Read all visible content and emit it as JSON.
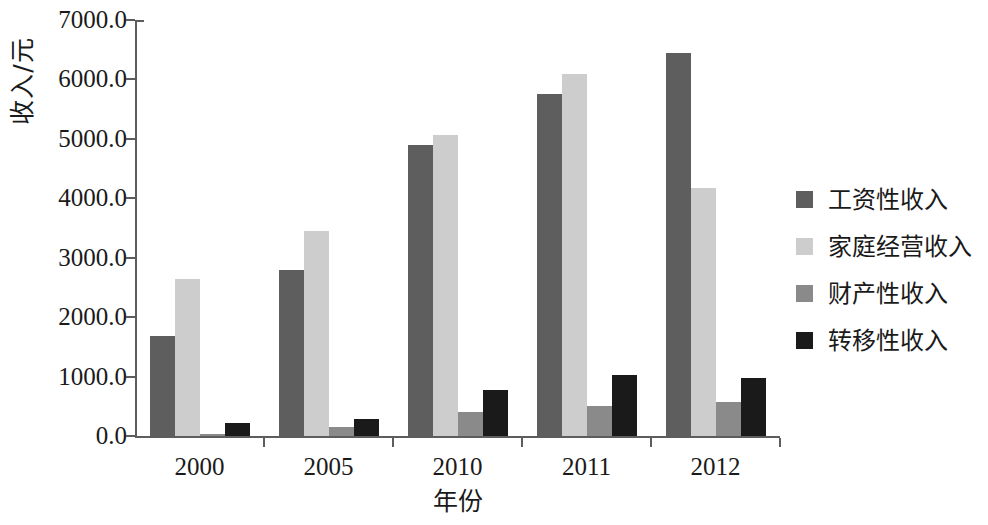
{
  "chart_data": {
    "type": "bar",
    "title": "",
    "xlabel": "年份",
    "ylabel": "收入/元",
    "categories": [
      "2000",
      "2005",
      "2010",
      "2011",
      "2012"
    ],
    "series": [
      {
        "name": "工资性收入",
        "color": "#5e5e5e",
        "values": [
          1680,
          2800,
          4890,
          5750,
          6450
        ]
      },
      {
        "name": "家庭经营收入",
        "color": "#cdcdcd",
        "values": [
          2650,
          3450,
          5060,
          6100,
          4170
        ]
      },
      {
        "name": "财产性收入",
        "color": "#8a8a8a",
        "values": [
          30,
          150,
          410,
          500,
          570
        ]
      },
      {
        "name": "转移性收入",
        "color": "#1a1a1a",
        "values": [
          220,
          290,
          780,
          1020,
          970
        ]
      }
    ],
    "ylim": [
      0,
      7000
    ],
    "ytick_values": [
      0,
      1000,
      2000,
      3000,
      4000,
      5000,
      6000,
      7000
    ],
    "ytick_labels": [
      "0.0",
      "1000.0",
      "2000.0",
      "3000.0",
      "4000.0",
      "5000.0",
      "6000.0",
      "7000.0"
    ],
    "grid": false,
    "legend_position": "right",
    "axis_color": "#5d5d5d",
    "background_color": "#ffffff"
  }
}
